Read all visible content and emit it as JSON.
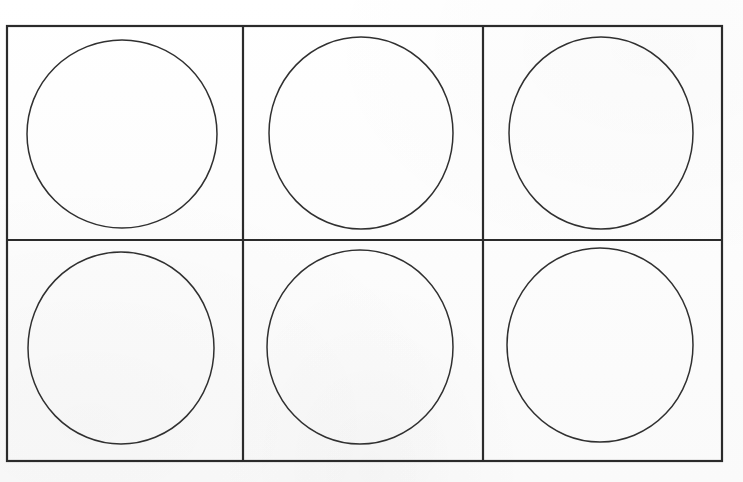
{
  "document": {
    "kind": "scanned-worksheet",
    "title": "Blank circle grid worksheet",
    "background_color": "#fdfdfd",
    "ink_color": "#2b2b2b",
    "circle_stroke_color": "#303030"
  },
  "canvas": {
    "width": 743,
    "height": 482
  },
  "grid": {
    "name": "circle-grid-table",
    "columns": 3,
    "rows": 2,
    "cell_count": 6,
    "border_width": 2.2,
    "outer": {
      "left": 7,
      "top": 26,
      "right": 722,
      "bottom": 461
    },
    "vertical_dividers": [
      243,
      483
    ],
    "horizontal_dividers": [
      240
    ]
  },
  "cells": [
    {
      "id": "cell-r1c1",
      "row": 1,
      "column": 1,
      "label": "Top left cell",
      "bounds": {
        "left": 7,
        "top": 26,
        "right": 243,
        "bottom": 240
      },
      "shape": {
        "name": "circle-r1c1",
        "type": "circle",
        "cx": 122,
        "cy": 134,
        "rx": 95,
        "ry": 94,
        "stroke_width": 1.5,
        "rotation": 0
      }
    },
    {
      "id": "cell-r1c2",
      "row": 1,
      "column": 2,
      "label": "Top middle cell",
      "bounds": {
        "left": 243,
        "top": 26,
        "right": 483,
        "bottom": 240
      },
      "shape": {
        "name": "circle-r1c2",
        "type": "circle",
        "cx": 361,
        "cy": 133,
        "rx": 92,
        "ry": 96,
        "stroke_width": 1.5,
        "rotation": 0
      }
    },
    {
      "id": "cell-r1c3",
      "row": 1,
      "column": 3,
      "label": "Top right cell",
      "bounds": {
        "left": 483,
        "top": 26,
        "right": 722,
        "bottom": 240
      },
      "shape": {
        "name": "circle-r1c3",
        "type": "circle",
        "cx": 601,
        "cy": 133,
        "rx": 92,
        "ry": 96,
        "stroke_width": 1.5,
        "rotation": 0
      }
    },
    {
      "id": "cell-r2c1",
      "row": 2,
      "column": 1,
      "label": "Bottom left cell",
      "bounds": {
        "left": 7,
        "top": 240,
        "right": 243,
        "bottom": 461
      },
      "shape": {
        "name": "circle-r2c1",
        "type": "circle",
        "cx": 121,
        "cy": 348,
        "rx": 93,
        "ry": 96,
        "stroke_width": 1.5,
        "rotation": 0
      }
    },
    {
      "id": "cell-r2c2",
      "row": 2,
      "column": 2,
      "label": "Bottom middle cell",
      "bounds": {
        "left": 243,
        "top": 240,
        "right": 483,
        "bottom": 461
      },
      "shape": {
        "name": "circle-r2c2",
        "type": "circle",
        "cx": 360,
        "cy": 347,
        "rx": 93,
        "ry": 97,
        "stroke_width": 1.5,
        "rotation": 0
      }
    },
    {
      "id": "cell-r2c3",
      "row": 2,
      "column": 3,
      "label": "Bottom right cell",
      "bounds": {
        "left": 483,
        "top": 240,
        "right": 722,
        "bottom": 461
      },
      "shape": {
        "name": "circle-r2c3",
        "type": "circle",
        "cx": 600,
        "cy": 345,
        "rx": 93,
        "ry": 97,
        "stroke_width": 1.5,
        "rotation": 0
      }
    }
  ]
}
